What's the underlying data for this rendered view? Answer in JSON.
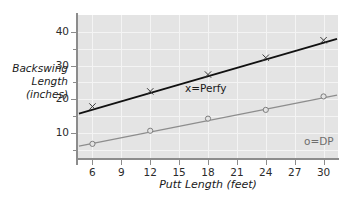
{
  "chart_data": {
    "type": "line",
    "title": "",
    "xlabel": "Putt Length (feet)",
    "ylabel": "Backswing Length (inches)",
    "ylabel_lines": [
      "Backswing",
      "Length",
      "(inches)"
    ],
    "x": [
      6,
      12,
      18,
      24,
      30
    ],
    "xlim": [
      4.5,
      31.5
    ],
    "ylim": [
      2.5,
      45
    ],
    "xticks": [
      6,
      9,
      12,
      15,
      18,
      21,
      24,
      27,
      30
    ],
    "xticklabels": [
      "6",
      "9",
      "12",
      "15",
      "18",
      "21",
      "24",
      "27",
      "30"
    ],
    "yticks": [
      10,
      20,
      30,
      40
    ],
    "yticklabels": [
      "10",
      "20",
      "30",
      "40"
    ],
    "yticks_minor": [
      5,
      15,
      25,
      35
    ],
    "grid": true,
    "grid_color": "#f4f4f4",
    "plot_bg": "#e4e4e4",
    "legend_position": "inside-plot",
    "series": [
      {
        "name": "x=Perfy",
        "label": "x=Perfy",
        "marker": "x",
        "color": "#111111",
        "values": [
          17.8,
          22.3,
          27.3,
          32.3,
          37.5
        ],
        "fit_endpoints": [
          {
            "x": 4.6,
            "y": 15.7
          },
          {
            "x": 31.4,
            "y": 37.9
          }
        ]
      },
      {
        "name": "o=DP",
        "label": "o=DP",
        "marker": "o",
        "color": "#8d8d8d",
        "values": [
          6.7,
          10.6,
          14.2,
          16.8,
          20.8
        ],
        "fit_endpoints": [
          {
            "x": 4.6,
            "y": 6.0
          },
          {
            "x": 31.4,
            "y": 21.2
          }
        ]
      }
    ]
  },
  "axes": {
    "axis_color": "#8c8c8c",
    "tick_label_color": "#2b2b2b"
  }
}
